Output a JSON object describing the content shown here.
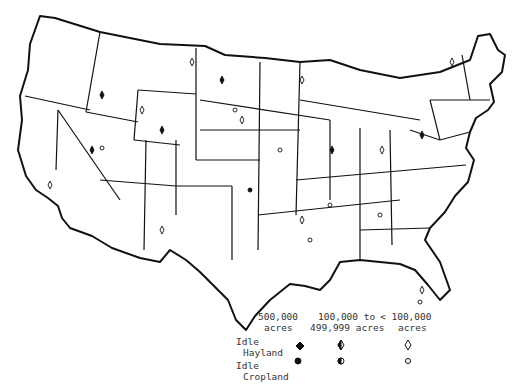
{
  "map": {
    "subject": "Idle hayland and idle cropland by region, continental United States",
    "regions": "contiguous US states subdivided into agricultural districts",
    "symbol_sizes": [
      "500,000 acres",
      "100,000 to 499,999 acres",
      "< 100,000 acres"
    ]
  },
  "legend": {
    "columns": [
      {
        "line1": "500,000",
        "line2": "acres"
      },
      {
        "line1": "100,000 to",
        "line2": "499,999 acres"
      },
      {
        "line1": "< 100,000",
        "line2": "acres"
      }
    ],
    "rows": [
      {
        "line1": "Idle",
        "line2": "Hayland",
        "symbols": [
          "solid-diamond",
          "half-diamond",
          "open-diamond"
        ]
      },
      {
        "line1": "Idle",
        "line2": "Cropland",
        "symbols": [
          "solid-circle",
          "half-circle",
          "open-circle"
        ]
      }
    ]
  }
}
